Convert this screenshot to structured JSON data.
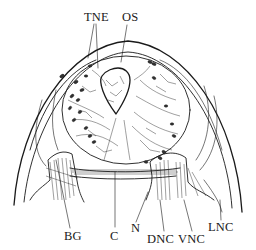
{
  "figure": {
    "type": "anatomical cross-section line drawing",
    "labels": [
      {
        "id": "TNE",
        "text": "TNE",
        "x": 84,
        "y": 21
      },
      {
        "id": "OS",
        "text": "OS",
        "x": 122,
        "y": 21
      },
      {
        "id": "BG",
        "text": "BG",
        "x": 64,
        "y": 240
      },
      {
        "id": "C",
        "text": "C",
        "x": 110,
        "y": 240
      },
      {
        "id": "N",
        "text": "N",
        "x": 131,
        "y": 232
      },
      {
        "id": "DNC",
        "text": "DNC",
        "x": 147,
        "y": 243
      },
      {
        "id": "VNC",
        "text": "VNC",
        "x": 178,
        "y": 243
      },
      {
        "id": "LNC",
        "text": "LNC",
        "x": 208,
        "y": 231
      }
    ],
    "colors": {
      "ink": "#1a1a1a",
      "background": "#ffffff"
    }
  }
}
